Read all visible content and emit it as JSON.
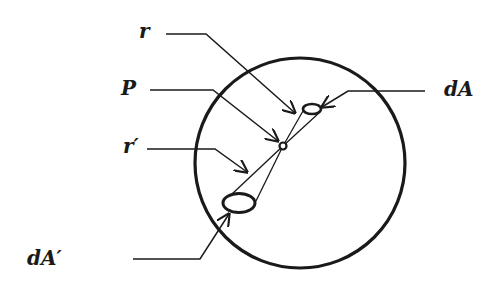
{
  "diagram": {
    "type": "geometric-illustration",
    "colors": {
      "stroke": "#1a1a1a",
      "background": "#ffffff"
    },
    "circle": {
      "cx": 300,
      "cy": 163,
      "r": 105
    },
    "point_P": {
      "cx": 283,
      "cy": 146,
      "r": 3.5
    },
    "element_dA": {
      "cx": 312,
      "cy": 109,
      "rx": 9,
      "ry": 5
    },
    "element_dA_prime": {
      "cx": 239,
      "cy": 203,
      "rx": 16,
      "ry": 10
    },
    "labels": {
      "r": "r",
      "P": "P",
      "r_prime": "r′",
      "dA": "dA",
      "dA_prime": "dA′"
    }
  }
}
